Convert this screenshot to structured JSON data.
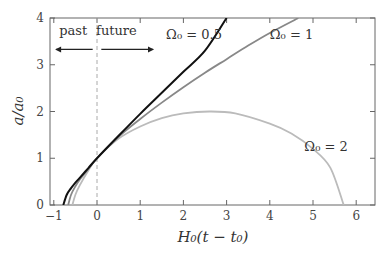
{
  "chart_data": {
    "type": "line",
    "title": "",
    "xlabel": "H₀(t − t₀)",
    "ylabel": "a/a₀",
    "xlim": [
      -1.1,
      6.5
    ],
    "ylim": [
      0,
      4
    ],
    "xticks": [
      -1,
      0,
      1,
      2,
      3,
      4,
      5,
      6
    ],
    "xtick_labels": [
      "−1",
      "0",
      "1",
      "2",
      "3",
      "4",
      "5",
      "6"
    ],
    "yticks": [
      0,
      1,
      2,
      3,
      4
    ],
    "ytick_labels": [
      "0",
      "1",
      "2",
      "3",
      "4"
    ],
    "grid": false,
    "annotations": [
      {
        "text": "past",
        "arrow": "left",
        "x": -0.55,
        "y": 3.5
      },
      {
        "text": "future",
        "arrow": "right",
        "x": 0.45,
        "y": 3.5
      },
      {
        "text": "present divider (dashed line)",
        "x": 0
      }
    ],
    "series": [
      {
        "name": "Ω₀ = 0.5",
        "label": "Ω₀ = 0.5",
        "color": "#111111",
        "label_pos": [
          1.6,
          3.55
        ],
        "x": [
          -0.78,
          -0.7,
          -0.6,
          -0.5,
          -0.4,
          -0.2,
          0,
          0.5,
          1,
          1.5,
          2,
          2.5,
          3.0
        ],
        "y": [
          0,
          0.22,
          0.36,
          0.48,
          0.58,
          0.79,
          1.0,
          1.48,
          1.95,
          2.4,
          2.85,
          3.3,
          4.0
        ]
      },
      {
        "name": "Ω₀ = 1",
        "label": "Ω₀ = 1",
        "color": "#888888",
        "label_pos": [
          4.0,
          3.55
        ],
        "x": [
          -0.667,
          -0.6,
          -0.5,
          -0.4,
          -0.2,
          0,
          0.5,
          1,
          1.5,
          2,
          2.5,
          3,
          3.5,
          4,
          4.66
        ],
        "y": [
          0,
          0.22,
          0.4,
          0.54,
          0.77,
          1.0,
          1.46,
          1.84,
          2.19,
          2.52,
          2.83,
          3.12,
          3.41,
          3.68,
          4.0
        ]
      },
      {
        "name": "Ω₀ = 2",
        "label": "Ω₀ = 2",
        "color": "#bbbbbb",
        "label_pos": [
          4.8,
          1.15
        ],
        "x": [
          -0.57,
          -0.5,
          -0.4,
          -0.2,
          0,
          0.5,
          1,
          1.5,
          2,
          2.6,
          3.2,
          4,
          4.5,
          5,
          5.4,
          5.71
        ],
        "y": [
          0,
          0.22,
          0.42,
          0.74,
          1.0,
          1.42,
          1.68,
          1.86,
          1.96,
          2.0,
          1.96,
          1.74,
          1.53,
          1.2,
          0.8,
          0
        ]
      }
    ]
  }
}
